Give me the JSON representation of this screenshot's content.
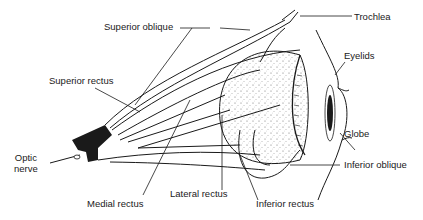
{
  "diagram": {
    "labels": {
      "superior_oblique": "Superior oblique",
      "trochlea": "Trochlea",
      "eyelids": "Eyelids",
      "superior_rectus": "Superior rectus",
      "globe": "Globe",
      "optic_nerve": "Optic\nnerve",
      "inferior_oblique": "Inferior oblique",
      "medial_rectus": "Medial rectus",
      "lateral_rectus": "Lateral rectus",
      "inferior_rectus": "Inferior rectus"
    },
    "colors": {
      "line": "#1a1a1a",
      "background": "#ffffff"
    }
  }
}
